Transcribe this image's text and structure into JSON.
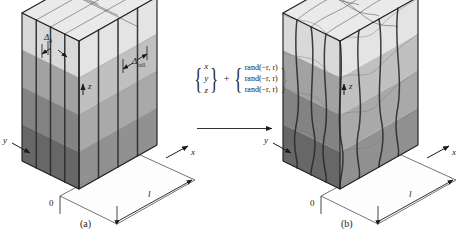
{
  "figure": {
    "type": "two-panel-schematic",
    "background": "#ffffff"
  },
  "panel_a": {
    "caption": "(a)",
    "origin_label": "0",
    "length_label": "l",
    "axes": {
      "x": "x",
      "y": "y",
      "z": "z"
    },
    "annotations": [
      {
        "symbol": "Δ",
        "subscript": "0"
      },
      {
        "symbol": "Δ",
        "subscript": "cell"
      }
    ],
    "grid": {
      "nx": 4,
      "ny": 4,
      "nz": 4,
      "perturbed": false
    }
  },
  "panel_b": {
    "caption": "(b)",
    "origin_label": "0",
    "length_label": "l",
    "axes": {
      "x": "x",
      "y": "y",
      "z": "z"
    },
    "grid": {
      "nx": 4,
      "ny": 4,
      "nz": 4,
      "perturbed": true
    }
  },
  "equation": {
    "left_vector": [
      "x",
      "y",
      "z"
    ],
    "operator": "+",
    "right_vector": [
      "rand(−r, r)",
      "rand(−r, r)",
      "rand(−r, r)"
    ],
    "rand_name": "rand",
    "rand_args": "(−r, r)",
    "arrow": "right-arrow"
  },
  "colors": {
    "ink": "#1b1b1b",
    "edge_light": "#6d6d6d",
    "edge_dark": "#2e2e2e",
    "face_top": "#d8d8d8",
    "face_left": "#9a9a9a",
    "face_right": "#bdbdbd",
    "base_plate": "#fdfdfd"
  }
}
